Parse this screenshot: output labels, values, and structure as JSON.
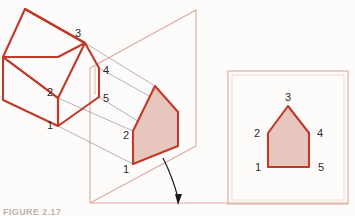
{
  "figure": {
    "caption": "FIGURE 2.17",
    "colors": {
      "object_outline": "#c0392b",
      "object_outline_dark": "#b33225",
      "plane_outline": "#d9a99e",
      "projector_line": "#9a8f9e",
      "shape_fill": "#e7c6bd",
      "shape_outline": "#c0392b",
      "frame_outline": "#d9a99e",
      "arrow": "#1a1a1a",
      "label_text": "#2b2b33",
      "background": "#fdfcfb"
    }
  },
  "object_view": {
    "name": "isometric-house",
    "description": "Pictorial house drawn in isometric view at left",
    "vertex_labels": [
      {
        "id": "1",
        "text": "1",
        "x": 50,
        "y": 129
      },
      {
        "id": "2",
        "text": "2",
        "x": 50,
        "y": 96
      },
      {
        "id": "3",
        "text": "3",
        "x": 78,
        "y": 37
      },
      {
        "id": "4",
        "text": "4",
        "x": 103,
        "y": 72
      },
      {
        "id": "5",
        "text": "5",
        "x": 103,
        "y": 100
      }
    ]
  },
  "picture_plane": {
    "name": "picture-plane",
    "description": "Transparent picture plane parallelogram holding projected image"
  },
  "projected_shape": {
    "name": "projected-pentagon",
    "description": "Foreshortened pentagon image on the picture plane",
    "vertex_labels": [
      {
        "id": "1",
        "text": "1",
        "x": 124,
        "y": 172
      },
      {
        "id": "2",
        "text": "2",
        "x": 124,
        "y": 137
      }
    ]
  },
  "result_view": {
    "name": "orthographic-result",
    "description": "True-shape pentagon shown in framed view at right",
    "vertex_labels": [
      {
        "id": "1",
        "text": "1",
        "x": 256,
        "y": 171
      },
      {
        "id": "2",
        "text": "2",
        "x": 255,
        "y": 137
      },
      {
        "id": "3",
        "text": "3",
        "x": 285,
        "y": 102
      },
      {
        "id": "4",
        "text": "4",
        "x": 315,
        "y": 137
      },
      {
        "id": "5",
        "text": "5",
        "x": 316,
        "y": 171
      }
    ]
  },
  "annotation_arrow": {
    "name": "rotation-arrow",
    "description": "Curved arrow indicating the plane rotates into the viewing position"
  }
}
